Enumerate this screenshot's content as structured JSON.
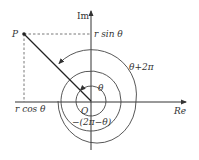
{
  "diagram": {
    "axes": {
      "real_label": "Re",
      "imag_label": "Im"
    },
    "origin_label": "O",
    "point_label": "P",
    "projection_labels": {
      "x": "r cos θ",
      "y": "r sin θ"
    },
    "angle_labels": {
      "inner": "θ",
      "outer": "θ+2π",
      "negative": "−(2π−θ)"
    },
    "colors": {
      "ink": "#333333",
      "background": "#ffffff"
    }
  }
}
